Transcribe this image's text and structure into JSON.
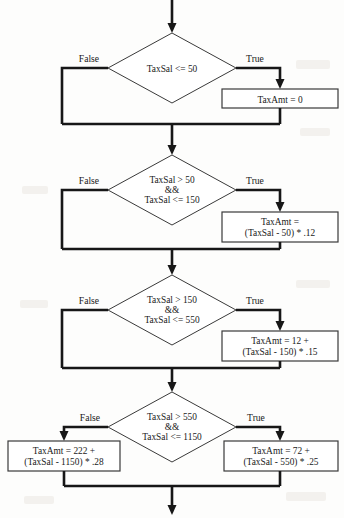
{
  "diagram": {
    "type": "flowchart",
    "branch_labels": {
      "false": "False",
      "true": "True"
    },
    "operator_and": "&&",
    "nodes": [
      {
        "id": "d1",
        "kind": "decision",
        "lines": [
          "TaxSal <=  50"
        ],
        "false_label": "False",
        "true_label": "True",
        "true_target": "p1",
        "false_target": "merge1"
      },
      {
        "id": "p1",
        "kind": "process",
        "lines": [
          "TaxAmt = 0"
        ]
      },
      {
        "id": "d2",
        "kind": "decision",
        "lines": [
          "TaxSal > 50",
          "&&",
          "TaxSal <= 150"
        ],
        "false_label": "False",
        "true_label": "True",
        "true_target": "p2",
        "false_target": "merge2"
      },
      {
        "id": "p2",
        "kind": "process",
        "lines": [
          "TaxAmt =",
          "(TaxSal - 50) * .12"
        ]
      },
      {
        "id": "d3",
        "kind": "decision",
        "lines": [
          "TaxSal > 150",
          "&&",
          "TaxSal <= 550"
        ],
        "false_label": "False",
        "true_label": "True",
        "true_target": "p3",
        "false_target": "merge3"
      },
      {
        "id": "p3",
        "kind": "process",
        "lines": [
          "TaxAmt = 12 +",
          "(TaxSal - 150)  * .15"
        ]
      },
      {
        "id": "d4",
        "kind": "decision",
        "lines": [
          "TaxSal > 550",
          "&&",
          "TaxSal <= 1150"
        ],
        "false_label": "False",
        "true_label": "True",
        "true_target": "p4r",
        "false_target": "p4l"
      },
      {
        "id": "p4l",
        "kind": "process",
        "lines": [
          "TaxAmt = 222 +",
          "(TaxSal - 1150)  * .28"
        ]
      },
      {
        "id": "p4r",
        "kind": "process",
        "lines": [
          "TaxAmt = 72 +",
          "(TaxSal - 550)  * .25"
        ]
      }
    ]
  },
  "colors": {
    "line": "#171717",
    "shape_stroke": "#3a3a3a",
    "shape_fill": "#ffffff",
    "text": "#1a1a1a",
    "page_background": "#fdfdfc"
  }
}
